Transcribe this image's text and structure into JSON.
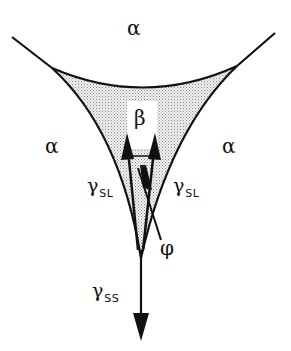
{
  "diagram": {
    "colors": {
      "line": "#111111",
      "shade": "#d9d9d9",
      "background": "#ffffff"
    },
    "regions": {
      "top": "α",
      "left": "α",
      "right": "α",
      "inclusion": "β"
    },
    "tensions": {
      "left": {
        "symbol": "γ",
        "subscript": "SL"
      },
      "right": {
        "symbol": "γ",
        "subscript": "SL"
      },
      "bottom": {
        "symbol": "γ",
        "subscript": "SS"
      }
    },
    "angle": "φ"
  }
}
